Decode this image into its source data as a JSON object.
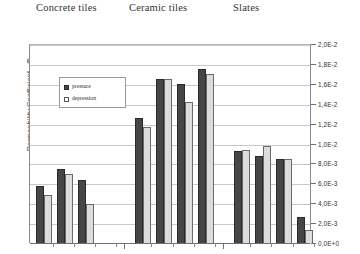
{
  "chart_data": {
    "type": "bar",
    "title": "",
    "xlabel": "",
    "ylabel": "Permeability Coefficient - Φ",
    "ylim": [
      0,
      0.02
    ],
    "ytick_labels": [
      "2,0E-2",
      "1,8E-2",
      "1,6E-2",
      "1,4E-2",
      "1,2E-2",
      "1,0E-2",
      "8,0E-3",
      "6,0E-3",
      "4,0E-3",
      "2,0E-3",
      "0,0E+0"
    ],
    "ytick_values": [
      0.02,
      0.018,
      0.016,
      0.014,
      0.012,
      0.01,
      0.008,
      0.006,
      0.004,
      0.002,
      0.0
    ],
    "grid": true,
    "legend_position": "upper-left-inside",
    "group_labels": [
      "Concrete tiles",
      "Ceramic tiles",
      "Slates"
    ],
    "categories": [
      "C1",
      "C2",
      "C3",
      "C4",
      "K1",
      "K2",
      "K3",
      "K4",
      "S1",
      "S2",
      "S3",
      "S4"
    ],
    "series": [
      {
        "name": "pressure",
        "color": "#464646",
        "values": [
          0.0057,
          0.0074,
          0.0063,
          0.0,
          0.0126,
          0.0165,
          0.016,
          0.0175,
          0.0092,
          0.0087,
          0.0084,
          0.0026
        ]
      },
      {
        "name": "depression",
        "color": "#dcdcdc",
        "values": [
          0.0048,
          0.0069,
          0.0039,
          0.0,
          0.0117,
          0.0165,
          0.0142,
          0.017,
          0.0093,
          0.0098,
          0.0084,
          0.0013
        ]
      }
    ],
    "group_boundaries": [
      4,
      8
    ]
  },
  "legend": {
    "items": [
      {
        "label": "pressure"
      },
      {
        "label": "depression"
      }
    ]
  },
  "headings": {
    "concrete": "Concrete tiles",
    "ceramic": "Ceramic tiles",
    "slates": "Slates"
  },
  "axis": {
    "y_title": "Permeability Coefficient - Φ"
  }
}
